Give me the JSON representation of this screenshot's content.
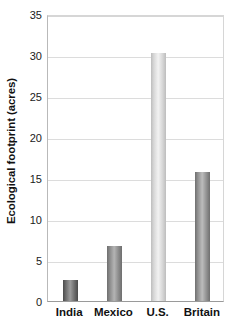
{
  "chart_data": {
    "type": "bar",
    "title": "",
    "subtitle": "",
    "xlabel": "",
    "ylabel": "Ecological footprint (acres)",
    "categories": [
      "India",
      "Mexico",
      "U.S.",
      "Britain"
    ],
    "values": [
      2.6,
      6.7,
      30.2,
      15.7
    ],
    "ylim": [
      0,
      35
    ],
    "yticks": [
      0,
      5,
      10,
      15,
      20,
      25,
      30,
      35
    ],
    "ytick_labels": [
      "0",
      "5",
      "10",
      "15",
      "20",
      "25",
      "30",
      "35"
    ],
    "grid": true,
    "grid_axis": "y",
    "legend": false,
    "legend_position": "none",
    "annotations": [],
    "bar_colors": [
      "#6b6b6b",
      "#8a8a8a",
      "#d6d6d6",
      "#8f8f8f"
    ],
    "bar_highlight_colors": [
      "#9c9c9c",
      "#b4b4b4",
      "#f2f2f2",
      "#bcbcbc"
    ],
    "bar_edge_colors": [
      "#4a4a4a",
      "#6e6e6e",
      "#bdbdbd",
      "#6f6f6f"
    ]
  },
  "axes": {
    "y_title": "Ecological footprint (acres)",
    "background": "#ffffff",
    "grid_color": "#dcdcdc",
    "axis_color": "#9a9a9a"
  }
}
